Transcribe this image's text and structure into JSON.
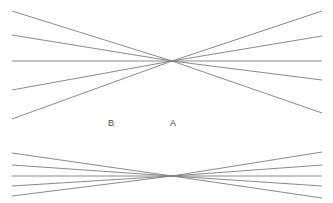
{
  "figure": {
    "background_color": "#ffffff",
    "line_color": "#7d7d7d",
    "line_width": 0.9,
    "label_color": "#4a4a4a",
    "width": 333,
    "height": 203
  },
  "labels": [
    {
      "id": "label-b",
      "text": "B",
      "x": 108,
      "y": 119
    },
    {
      "id": "label-a",
      "text": "A",
      "x": 170,
      "y": 119
    }
  ],
  "chart_data": {
    "type": "line",
    "subtitle": "",
    "xlabel": "",
    "ylabel": "",
    "xlim": [
      0,
      333
    ],
    "ylim": [
      0,
      203
    ],
    "grid": false,
    "legend": "none",
    "annotations": [
      {
        "text": "B",
        "x": 110,
        "y": 124
      },
      {
        "text": "A",
        "x": 172,
        "y": 124
      }
    ],
    "vanishing_points": [
      {
        "name": "upper",
        "x": 172,
        "y": 61
      },
      {
        "name": "lower",
        "x": 172,
        "y": 176
      }
    ],
    "series": [
      {
        "name": "upper-fan-line-1",
        "group": "upper",
        "x": [
          12,
          322
        ],
        "y": [
          11,
          11
        ]
      },
      {
        "name": "upper-fan-line-2",
        "group": "upper",
        "x": [
          12,
          322
        ],
        "y": [
          35,
          36
        ]
      },
      {
        "name": "upper-fan-line-3-horizontal",
        "group": "upper",
        "x": [
          12,
          322
        ],
        "y": [
          61,
          61
        ]
      },
      {
        "name": "upper-fan-line-4",
        "group": "upper",
        "x": [
          12,
          322
        ],
        "y": [
          90,
          80
        ]
      },
      {
        "name": "upper-fan-line-5",
        "group": "upper",
        "x": [
          12,
          322
        ],
        "y": [
          119,
          113
        ]
      },
      {
        "name": "lower-fan-line-1",
        "group": "lower",
        "x": [
          12,
          322
        ],
        "y": [
          153,
          152
        ]
      },
      {
        "name": "lower-fan-line-2",
        "group": "lower",
        "x": [
          12,
          322
        ],
        "y": [
          165,
          165
        ]
      },
      {
        "name": "lower-fan-line-3-horizontal",
        "group": "lower",
        "x": [
          12,
          322
        ],
        "y": [
          176,
          176
        ]
      },
      {
        "name": "lower-fan-line-4",
        "group": "lower",
        "x": [
          12,
          322
        ],
        "y": [
          186,
          186
        ]
      },
      {
        "name": "lower-fan-line-5",
        "group": "lower",
        "x": [
          12,
          322
        ],
        "y": [
          196,
          198
        ]
      }
    ]
  }
}
